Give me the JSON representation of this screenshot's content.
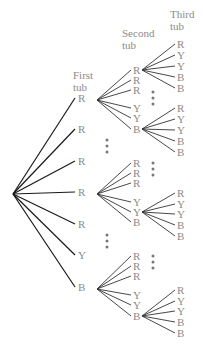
{
  "headers": {
    "first": [
      "First",
      "tub"
    ],
    "second": [
      "Second",
      "tub"
    ],
    "third": [
      "Third",
      "tub"
    ]
  },
  "first_tub": [
    "R",
    "R",
    "R",
    "R",
    "R",
    "Y",
    "B"
  ],
  "second_tub_group": [
    "R",
    "R",
    "R",
    "Y",
    "Y",
    "B"
  ],
  "third_tub_group": [
    "R",
    "Y",
    "Y",
    "B",
    "B"
  ],
  "ellipsis": "⋮",
  "colors": {
    "label": "#8a8a8a",
    "line": "#1a1a1a"
  }
}
